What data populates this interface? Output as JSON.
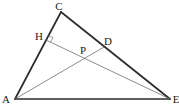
{
  "figure": {
    "width": 179,
    "height": 108,
    "background_color": "#ffffff",
    "thick_stroke_color": "#2b2b2b",
    "thin_stroke_color": "#6e6e6e",
    "label_color": "#1c1c1c",
    "thick_stroke_width": 1.7,
    "thin_stroke_width": 0.8,
    "points": {
      "A": [
        15,
        99
      ],
      "C": [
        61,
        12
      ],
      "E": [
        170,
        99
      ],
      "H": [
        46,
        40
      ],
      "D": [
        104,
        47
      ],
      "P": [
        85,
        58
      ]
    },
    "thick_edges": [
      [
        "A",
        "C"
      ],
      [
        "C",
        "E"
      ],
      [
        "A",
        "E"
      ]
    ],
    "thin_edges": [
      [
        "A",
        "D"
      ],
      [
        "H",
        "E"
      ]
    ],
    "right_angle_mark": {
      "at": "H",
      "toward": [
        "C",
        "E"
      ],
      "size": 5
    },
    "labels": [
      {
        "text": "C",
        "x": 59,
        "y": 6
      },
      {
        "text": "H",
        "x": 39,
        "y": 36
      },
      {
        "text": "D",
        "x": 108,
        "y": 41
      },
      {
        "text": "P",
        "x": 83,
        "y": 50
      },
      {
        "text": "A",
        "x": 6,
        "y": 99
      },
      {
        "text": "E",
        "x": 176,
        "y": 99
      }
    ]
  }
}
